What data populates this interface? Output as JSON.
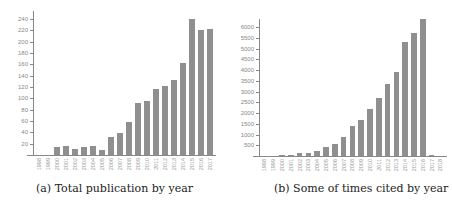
{
  "chart_data": [
    {
      "type": "bar",
      "title": "(a) Total publication by year",
      "xlabel": "",
      "ylabel": "",
      "ylim": [
        0,
        240
      ],
      "yticks": [
        20,
        40,
        60,
        80,
        100,
        120,
        140,
        160,
        180,
        200,
        220,
        240
      ],
      "categories": [
        "1998",
        "1999",
        "2000",
        "2001",
        "2002",
        "2003",
        "2004",
        "2005",
        "2006",
        "2007",
        "2008",
        "2009",
        "2010",
        "2011",
        "2012",
        "2013",
        "2014",
        "2015",
        "2016",
        "2017"
      ],
      "values": [
        0,
        0,
        14,
        16,
        10,
        15,
        16,
        8,
        32,
        38,
        58,
        92,
        96,
        117,
        122,
        132,
        162,
        240,
        220,
        222
      ],
      "grid": false,
      "color": "#8f8f8f"
    },
    {
      "type": "bar",
      "title": "(b) Some of times cited by year",
      "xlabel": "",
      "ylabel": "",
      "ylim": [
        0,
        6500
      ],
      "yticks": [
        500,
        1000,
        1500,
        2000,
        2500,
        3000,
        3500,
        4000,
        4500,
        5000,
        5500,
        6000
      ],
      "categories": [
        "1998",
        "1999",
        "2000",
        "2001",
        "2002",
        "2003",
        "2004",
        "2005",
        "2006",
        "2007",
        "2008",
        "2009",
        "2010",
        "2011",
        "2012",
        "2013",
        "2014",
        "2015",
        "2016",
        "2017",
        "2018"
      ],
      "values": [
        0,
        0,
        10,
        60,
        130,
        150,
        250,
        400,
        580,
        880,
        1380,
        1680,
        2200,
        2700,
        3330,
        3900,
        5280,
        5700,
        6380,
        30,
        0
      ],
      "grid": false,
      "color": "#8f8f8f"
    }
  ],
  "captions": {
    "a": "(a) Total publication by year",
    "b": "(b) Some of times cited by year"
  }
}
